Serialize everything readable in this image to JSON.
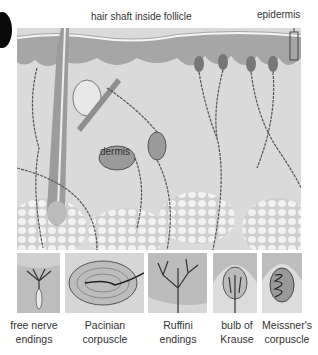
{
  "figure": {
    "marker": "black-circle",
    "main_labels": {
      "hair_shaft": "hair shaft inside follicle",
      "epidermis": "epidermis",
      "dermis": "dermis"
    },
    "receptors": [
      {
        "line1": "free nerve",
        "line2": "endings"
      },
      {
        "line1": "Pacinian",
        "line2": "corpuscle"
      },
      {
        "line1": "Ruffini",
        "line2": "endings"
      },
      {
        "line1": "bulb of",
        "line2": "Krause"
      },
      {
        "line1": "Meissner's",
        "line2": "corpuscle"
      }
    ],
    "colors": {
      "background": "#ffffff",
      "epidermis": "#a8a8a8",
      "dermis": "#d9d9d9",
      "fat": "#e6e6e6",
      "nerve": "#555555",
      "text": "#333333"
    }
  }
}
